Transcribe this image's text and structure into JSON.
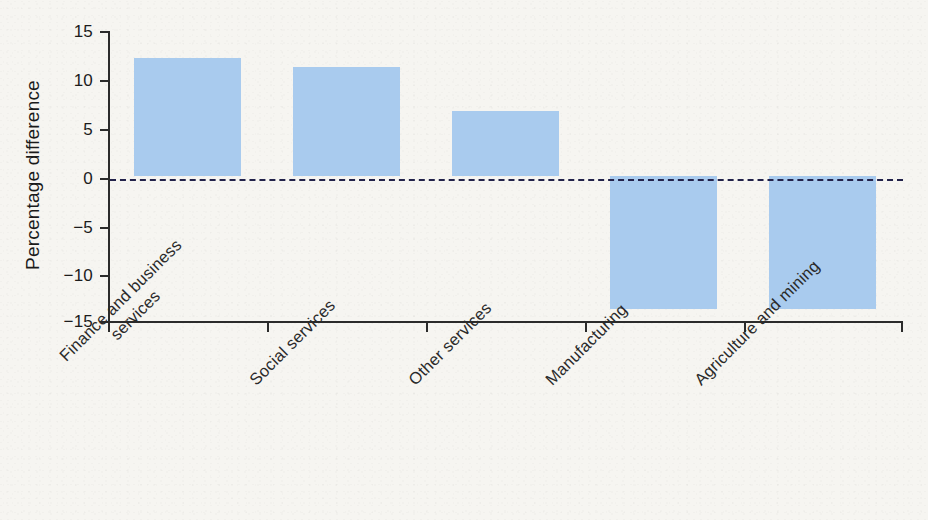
{
  "chart_data": {
    "type": "bar",
    "title": "",
    "subtitle": "",
    "xlabel": "",
    "ylabel": "Percentage difference",
    "categories": [
      "Finance and business services",
      "Social services",
      "Other services",
      "Manufacturing",
      "Agriculture and mining"
    ],
    "category_lines": [
      [
        "Finance and business",
        "services"
      ],
      [
        "Social services",
        ""
      ],
      [
        "Other services",
        ""
      ],
      [
        "Manufacturing",
        ""
      ],
      [
        "Agriculture and mining",
        ""
      ]
    ],
    "values": [
      12.2,
      11.3,
      6.7,
      -13.8,
      -13.8
    ],
    "ylim": [
      -15,
      15
    ],
    "ytick_labels": [
      "15",
      "10",
      "5",
      "0",
      "−5",
      "−10",
      "−15"
    ],
    "ytick_values": [
      15,
      10,
      5,
      0,
      -5,
      -10,
      -15
    ],
    "grid": false,
    "legend": false,
    "zero_line": true,
    "zero_line_style": "dashed",
    "colors": {
      "bar": "#a9cbee",
      "axis": "#2b2b2b",
      "zero_line": "#22224a",
      "text": "#1a1a1a",
      "background": "#f6f5f1"
    }
  }
}
